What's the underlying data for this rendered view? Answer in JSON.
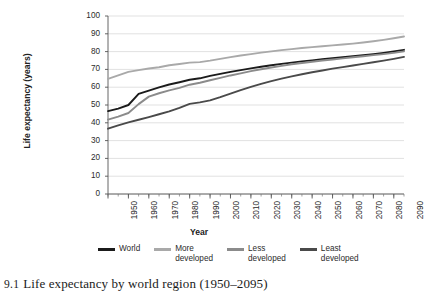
{
  "caption": {
    "number": "9.1",
    "text": "Life expectancy by world region (1950–2095)"
  },
  "chart_data": {
    "type": "line",
    "title": "",
    "xlabel": "Year",
    "ylabel": "Life expectancy (years)",
    "xlim": [
      1950,
      2095
    ],
    "ylim": [
      0,
      100
    ],
    "ytick_step": 10,
    "xtick_step": 10,
    "minor_xtick_step": 5,
    "grid": "horizontal",
    "legend_position": "bottom",
    "yticks": [
      "0",
      "10",
      "20",
      "30",
      "40",
      "50",
      "60",
      "70",
      "80",
      "90",
      "100"
    ],
    "xticks": [
      "1950",
      "1960",
      "1970",
      "1980",
      "1990",
      "2000",
      "2010",
      "2020",
      "2030",
      "2040",
      "2050",
      "2060",
      "2070",
      "2080",
      "2090"
    ],
    "x": [
      1950,
      1955,
      1960,
      1965,
      1970,
      1975,
      1980,
      1985,
      1990,
      1995,
      2000,
      2005,
      2010,
      2015,
      2020,
      2025,
      2030,
      2035,
      2040,
      2045,
      2050,
      2055,
      2060,
      2065,
      2070,
      2075,
      2080,
      2085,
      2090,
      2095
    ],
    "series": [
      {
        "name": "World",
        "color": "#1b1b1b",
        "values": [
          46.6,
          48.0,
          50.0,
          56.2,
          58.1,
          59.9,
          61.5,
          62.8,
          64.2,
          65.0,
          66.4,
          67.5,
          68.6,
          69.6,
          70.6,
          71.5,
          72.3,
          73.1,
          73.8,
          74.5,
          75.1,
          75.7,
          76.3,
          76.9,
          77.4,
          78.0,
          78.6,
          79.3,
          80.1,
          81.0
        ]
      },
      {
        "name": "More\ndeveloped",
        "color": "#a9a9a9",
        "values": [
          64.7,
          66.6,
          68.6,
          69.6,
          70.5,
          71.2,
          72.3,
          73.0,
          73.8,
          74.1,
          74.9,
          75.9,
          76.9,
          77.8,
          78.6,
          79.4,
          80.1,
          80.8,
          81.4,
          82.0,
          82.5,
          83.0,
          83.5,
          84.0,
          84.5,
          85.1,
          85.8,
          86.6,
          87.5,
          88.5
        ]
      },
      {
        "name": "Less\ndeveloped",
        "color": "#8b8b8b",
        "values": [
          41.8,
          43.5,
          45.5,
          50.5,
          54.7,
          56.6,
          58.2,
          59.6,
          61.4,
          62.5,
          63.9,
          65.2,
          66.6,
          67.8,
          69.0,
          70.1,
          71.1,
          72.0,
          72.9,
          73.6,
          74.3,
          75.0,
          75.6,
          76.2,
          76.8,
          77.4,
          78.0,
          78.6,
          79.3,
          80.1
        ]
      },
      {
        "name": "Least\ndeveloped",
        "color": "#4a4a4a",
        "values": [
          36.7,
          38.6,
          40.2,
          41.7,
          43.2,
          44.8,
          46.4,
          48.4,
          50.6,
          51.5,
          52.6,
          54.4,
          56.4,
          58.4,
          60.2,
          61.9,
          63.4,
          64.8,
          66.1,
          67.3,
          68.4,
          69.4,
          70.4,
          71.3,
          72.2,
          73.1,
          74.0,
          74.9,
          75.9,
          77.0
        ]
      }
    ]
  },
  "legend": [
    {
      "label": "World",
      "color": "#1b1b1b"
    },
    {
      "label": "More\ndeveloped",
      "color": "#a9a9a9"
    },
    {
      "label": "Less\ndeveloped",
      "color": "#8b8b8b"
    },
    {
      "label": "Least\ndeveloped",
      "color": "#4a4a4a"
    }
  ]
}
